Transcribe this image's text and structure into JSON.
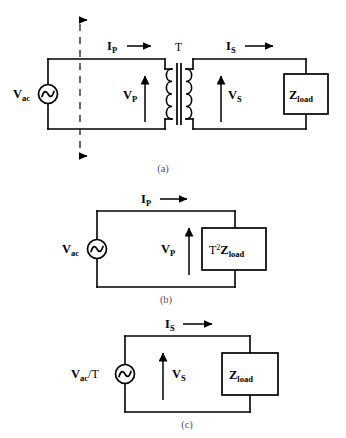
{
  "figure": {
    "type": "circuit-diagram",
    "background_color": "#ffffff",
    "line_color": "#000000",
    "panel_count": 3
  },
  "panels": [
    {
      "id": "a",
      "caption": "(a)",
      "description": "Transformer circuit with AC source on primary and load impedance on secondary",
      "source": {
        "symbol": "ac-source",
        "label_main": "V",
        "label_sub": "ac"
      },
      "transformer": {
        "label": "T",
        "primary_turns": 4,
        "secondary_turns": 4,
        "core": "double-bar"
      },
      "current_primary": {
        "label_main": "I",
        "label_sub": "P",
        "arrow": "right"
      },
      "current_secondary": {
        "label_main": "I",
        "label_sub": "S",
        "arrow": "right"
      },
      "voltage_primary": {
        "label_main": "V",
        "label_sub": "P",
        "arrow": "up"
      },
      "voltage_secondary": {
        "label_main": "V",
        "label_sub": "S",
        "arrow": "up"
      },
      "load": {
        "label_main": "Z",
        "label_sub": "load",
        "shape": "rectangle"
      },
      "dashed_reference_line": true,
      "dashed_arrows": 2
    },
    {
      "id": "b",
      "caption": "(b)",
      "description": "Primary-referred equivalent circuit with reflected load impedance",
      "source": {
        "symbol": "ac-source",
        "label_main": "V",
        "label_sub": "ac"
      },
      "current_primary": {
        "label_main": "I",
        "label_sub": "P",
        "arrow": "right"
      },
      "voltage_primary": {
        "label_main": "V",
        "label_sub": "P",
        "arrow": "up"
      },
      "load": {
        "label_prefix": "T",
        "label_sup": "2",
        "label_main": "Z",
        "label_sub": "load",
        "shape": "rectangle"
      }
    },
    {
      "id": "c",
      "caption": "(c)",
      "description": "Secondary-referred equivalent circuit with scaled source",
      "source": {
        "symbol": "ac-source",
        "label_main": "V",
        "label_sub": "ac",
        "label_suffix": "/T"
      },
      "current_secondary": {
        "label_main": "I",
        "label_sub": "S",
        "arrow": "right"
      },
      "voltage_secondary": {
        "label_main": "V",
        "label_sub": "S",
        "arrow": "up"
      },
      "load": {
        "label_main": "Z",
        "label_sub": "load",
        "shape": "rectangle"
      }
    }
  ]
}
